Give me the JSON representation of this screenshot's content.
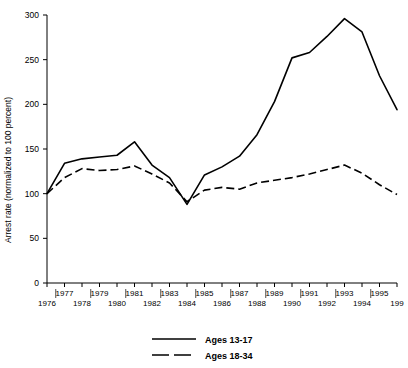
{
  "chart_data": {
    "type": "line",
    "title": "",
    "xlabel": "",
    "ylabel": "Arrest rate (normalized to 100 percent)",
    "ylim": [
      0,
      300
    ],
    "yticks": [
      0,
      50,
      100,
      150,
      200,
      250,
      300
    ],
    "ytick_labels": [
      "0",
      "50",
      "100",
      "150",
      "200",
      "250",
      "300"
    ],
    "xlim": [
      1976,
      1996
    ],
    "x": [
      1976,
      1977,
      1978,
      1979,
      1980,
      1981,
      1982,
      1983,
      1984,
      1985,
      1986,
      1987,
      1988,
      1989,
      1990,
      1991,
      1992,
      1993,
      1994,
      1995,
      1996
    ],
    "xtick_labels_upper": [
      "",
      "1977",
      "",
      "1979",
      "",
      "1981",
      "",
      "1983",
      "",
      "1985",
      "",
      "1987",
      "",
      "1989",
      "",
      "1991",
      "",
      "1993",
      "",
      "1995",
      ""
    ],
    "xtick_labels_lower": [
      "1976",
      "",
      "1978",
      "",
      "1980",
      "",
      "1982",
      "",
      "1984",
      "",
      "1986",
      "",
      "1988",
      "",
      "1990",
      "",
      "1992",
      "",
      "1994",
      "",
      "199"
    ],
    "grid": false,
    "legend_position": "bottom-center",
    "series": [
      {
        "name": "Ages 13-17",
        "style": "solid",
        "color": "#000000",
        "values": [
          100,
          134,
          139,
          141,
          143,
          158,
          132,
          118,
          88,
          121,
          130,
          142,
          166,
          203,
          252,
          258,
          276,
          296,
          281,
          232,
          194
        ]
      },
      {
        "name": "Ages 18-34",
        "style": "dashed",
        "color": "#000000",
        "values": [
          100,
          118,
          128,
          126,
          127,
          131,
          122,
          112,
          91,
          104,
          107,
          105,
          112,
          115,
          118,
          122,
          127,
          132,
          123,
          110,
          99
        ]
      }
    ],
    "legend": [
      {
        "label": "Ages 13-17",
        "style": "solid"
      },
      {
        "label": "Ages 18-34",
        "style": "dashed"
      }
    ]
  }
}
